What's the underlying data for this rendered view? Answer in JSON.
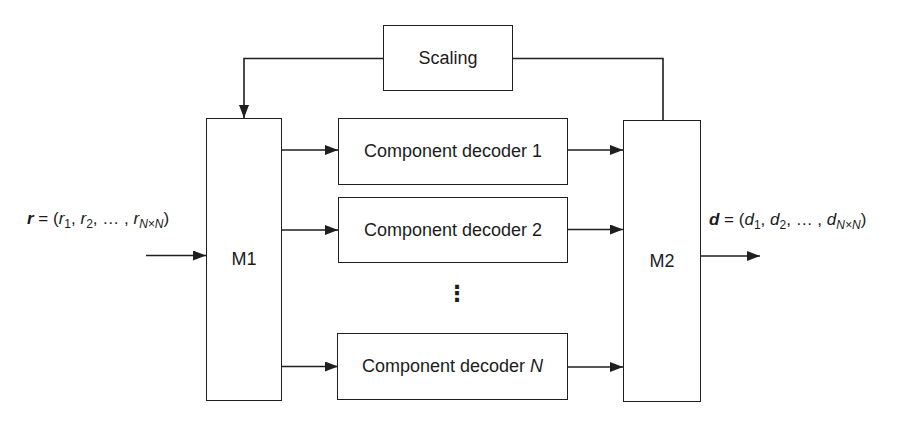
{
  "blocks": {
    "scaling": {
      "label": "Scaling"
    },
    "m1": {
      "label": "M1"
    },
    "m2": {
      "label": "M2"
    },
    "decoders": [
      {
        "name": "Component decoder",
        "index": "1"
      },
      {
        "name": "Component decoder",
        "index": "2"
      },
      {
        "name": "Component decoder",
        "index": "N"
      }
    ],
    "ellipsis": "⋮"
  },
  "io": {
    "input": {
      "var": "r",
      "eq": " = (",
      "e1": "r",
      "s1": "1",
      "c1": ", ",
      "e2": "r",
      "s2": "2",
      "c2": ", … , ",
      "e3": "r",
      "s3": "N×N",
      "close": ")"
    },
    "output": {
      "var": "d",
      "eq": " = (",
      "e1": "d",
      "s1": "1",
      "c1": ", ",
      "e2": "d",
      "s2": "2",
      "c2": ", … , ",
      "e3": "d",
      "s3": "N×N",
      "close": ")"
    }
  },
  "colors": {
    "line": "#1f1f1f",
    "text": "#1c1c1c",
    "background": "#ffffff"
  }
}
